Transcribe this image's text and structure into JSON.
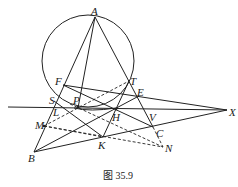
{
  "caption": "图 35.9",
  "points": {
    "A": "A",
    "B": "B",
    "C": "C",
    "E": "E",
    "F": "F",
    "H": "H",
    "K": "K",
    "L": "L",
    "M": "M",
    "N": "N",
    "P": "P",
    "S": "S",
    "T": "T",
    "V": "V",
    "X": "X"
  }
}
